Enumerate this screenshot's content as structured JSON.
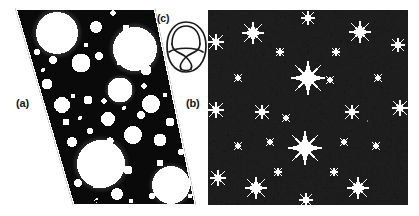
{
  "figure": {
    "canvas": {
      "width": 419,
      "height": 216,
      "background": "#ffffff"
    },
    "panels": [
      {
        "id": "a",
        "label": "(a)",
        "kind": "fractal-limit-set",
        "description": "black-and-white Apollonian-style fractal gasket inside a slanted parallelogram fundamental domain",
        "shape": "parallelogram",
        "corners": [
          [
            15,
            8
          ],
          [
            155,
            8
          ],
          [
            196,
            205
          ],
          [
            73,
            205
          ]
        ],
        "fill": "#0a0a0a",
        "hole_fill": "#ffffff",
        "label_position": [
          16,
          98
        ]
      },
      {
        "id": "b",
        "label": "(b)",
        "kind": "fractal-limit-set",
        "description": "grayscale dendritic limit set with white cusp bursts inside a square domain",
        "shape": "square",
        "bounds": [
          208,
          10,
          200,
          195
        ],
        "background": "#8c8c8c",
        "fill": "#1e1e1e",
        "highlight": "#ffffff",
        "label_position": [
          186,
          98
        ]
      },
      {
        "id": "c",
        "label": "(c)",
        "kind": "knot-diagram",
        "description": "figure-eight knot diagram drawn with a thin black stroke",
        "bounds": [
          168,
          20,
          38,
          52
        ],
        "stroke": "#1a1a1a",
        "label_position": [
          157,
          13
        ]
      }
    ],
    "colors": {
      "background": "#ffffff",
      "ink": "#0a0a0a",
      "mid_gray": "#8c8c8c",
      "dark_gray": "#1e1e1e",
      "label_ink": "#141414"
    }
  }
}
